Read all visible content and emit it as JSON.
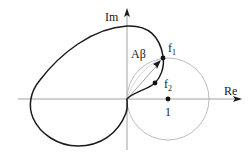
{
  "diagram": {
    "type": "nyquist-plot",
    "axes": {
      "x_label": "Re",
      "y_label": "Im"
    },
    "labels": {
      "vector": "Aβ",
      "f1_main": "f",
      "f1_sub": "1",
      "f2_main": "f",
      "f2_sub": "2",
      "unit_point": "1"
    },
    "points": [
      {
        "name": "f1",
        "description": "curve intersects circle centered at 1"
      },
      {
        "name": "f2",
        "description": "point on curve inside circle"
      },
      {
        "name": "1",
        "description": "point (1, 0) on real axis, center of circle"
      }
    ],
    "elements": [
      "closed loop Aβ curve passing through origin",
      "circle of unit radius centered at (1,0)",
      "arrow vector from origin to f1"
    ],
    "colors": {
      "curve": "#1a1a1a",
      "circle": "#b5b5b5",
      "axes": "#8a8a8a"
    }
  }
}
